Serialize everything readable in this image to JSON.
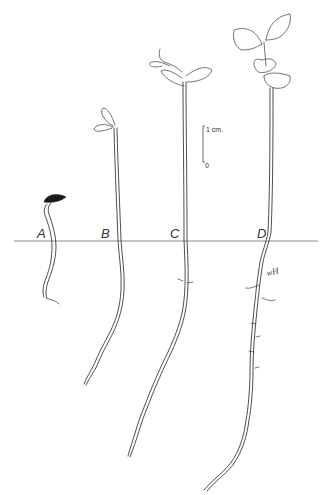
{
  "figure": {
    "stages": [
      {
        "id": "A",
        "label": "A",
        "description": "germinating seed with hooked hypocotyl and seed coat"
      },
      {
        "id": "B",
        "label": "B",
        "description": "seedling with emerging closed cotyledons"
      },
      {
        "id": "C",
        "label": "C",
        "description": "seedling with opened cotyledons and first leaf bud"
      },
      {
        "id": "D",
        "label": "D",
        "description": "seedling with expanded cotyledons and first true leaves"
      }
    ],
    "scale_bar": {
      "top_label": "1 cm.",
      "bottom_label": "0"
    },
    "artist_signature": "wH",
    "colors": {
      "ink": "#3a3a3a",
      "ground_line": "#8a8a8a",
      "seed_coat": "#1a1a1a",
      "background": "#ffffff"
    }
  }
}
